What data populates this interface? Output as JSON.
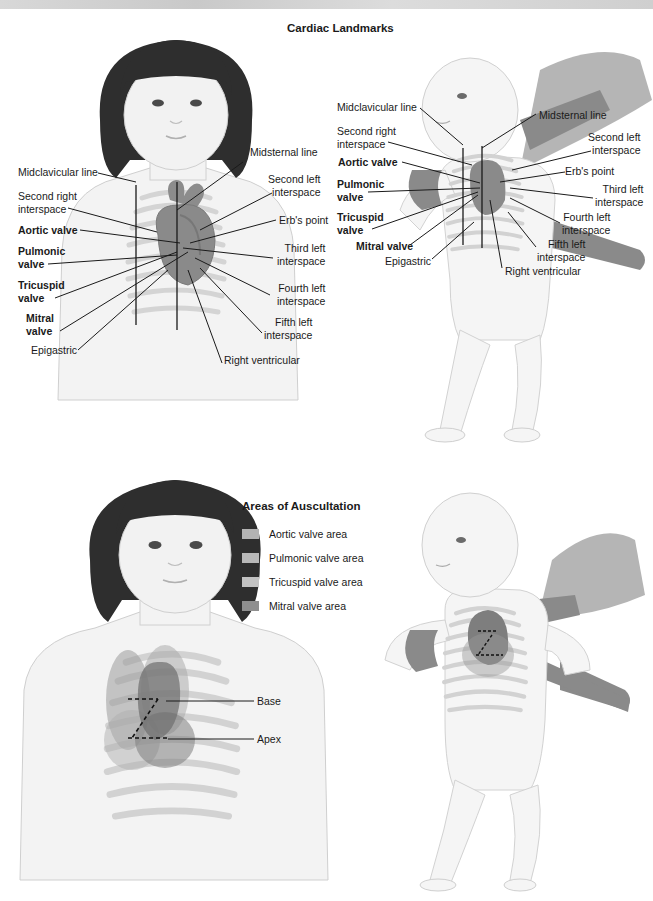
{
  "figure": {
    "section_top_title": "Cardiac Landmarks",
    "section_bottom_title": "Areas of Auscultation"
  },
  "landmarks_child": {
    "left_labels": [
      {
        "text": "Midclavicular line",
        "bold": false
      },
      {
        "text": "Second right\ninterspace",
        "bold": false
      },
      {
        "text": "Aortic valve",
        "bold": true
      },
      {
        "text": "Pulmonic\nvalve",
        "bold": true
      },
      {
        "text": "Tricuspid\nvalve",
        "bold": true
      },
      {
        "text": "Mitral\nvalve",
        "bold": true
      },
      {
        "text": "Epigastric",
        "bold": false
      }
    ],
    "right_labels": [
      {
        "text": "Midsternal line"
      },
      {
        "text": "Second left\ninterspace"
      },
      {
        "text": "Erb's point"
      },
      {
        "text": "Third left\ninterspace"
      },
      {
        "text": "Fourth left\ninterspace"
      },
      {
        "text": "Fifth left\ninterspace"
      },
      {
        "text": "Right ventricular"
      }
    ]
  },
  "landmarks_infant": {
    "left_labels": [
      {
        "text": "Midclavicular line",
        "bold": false
      },
      {
        "text": "Second right\ninterspace",
        "bold": false
      },
      {
        "text": "Aortic valve",
        "bold": true
      },
      {
        "text": "Pulmonic\nvalve",
        "bold": true
      },
      {
        "text": "Tricuspid\nvalve",
        "bold": true
      },
      {
        "text": "Mitral valve",
        "bold": true
      },
      {
        "text": "Epigastric",
        "bold": false
      }
    ],
    "right_labels": [
      {
        "text": "Midsternal line"
      },
      {
        "text": "Second left\ninterspace"
      },
      {
        "text": "Erb's point"
      },
      {
        "text": "Third left\ninterspace"
      },
      {
        "text": "Fourth left\ninterspace"
      },
      {
        "text": "Fifth left\ninterspace"
      },
      {
        "text": "Right ventricular"
      }
    ]
  },
  "auscultation_legend": {
    "items": [
      {
        "label": "Aortic valve area",
        "color": "#b3b3b3"
      },
      {
        "label": "Pulmonic valve area",
        "color": "#b8b8b8"
      },
      {
        "label": "Tricuspid valve area",
        "color": "#c2c2c2"
      },
      {
        "label": "Mitral valve area",
        "color": "#8f8f8f"
      }
    ]
  },
  "auscultation_child": {
    "labels": [
      {
        "text": "Base"
      },
      {
        "text": "Apex"
      }
    ]
  },
  "colors": {
    "hair": "#2e2e2e",
    "skin": "#f1f1f1",
    "skin_outline": "#c8c8c8",
    "ribs": "#d6d6d6",
    "heart": "#8c8c8c",
    "heart_dark": "#6e6e6e",
    "area_overlay": "#9a9a9a",
    "adult_hand": "#8a8a8a",
    "sleeve": "#b5b5b5",
    "leader_line": "#1a1a1a"
  }
}
